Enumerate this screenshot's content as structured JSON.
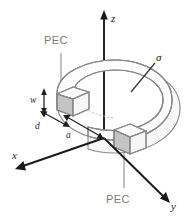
{
  "figure": {
    "background_color": "#ffffff",
    "width": 187,
    "height": 220
  },
  "axes": {
    "z": {
      "label": "z",
      "direction": "up",
      "color": "#1a1a1a"
    },
    "x": {
      "label": "x",
      "direction": "down-left",
      "color": "#1a1a1a"
    },
    "y": {
      "label": "y",
      "direction": "down-right",
      "color": "#1a1a1a"
    }
  },
  "annotations": {
    "pec_top": {
      "label": "PEC",
      "color": "#7b7b7b"
    },
    "pec_bottom": {
      "label": "PEC",
      "color": "#7b7b7b"
    },
    "sigma": {
      "label": "σ",
      "color": "#1a1a1a"
    }
  },
  "dimensions": {
    "w": {
      "label": "w",
      "description": "ring cross-section height"
    },
    "d": {
      "label": "d",
      "description": "ring cross-section depth"
    },
    "a": {
      "label": "a",
      "description": "inner radius from origin"
    }
  },
  "colors": {
    "ring_outline": "#8a8a8a",
    "pec_fill": "#c4c4c4",
    "axis": "#1a1a1a",
    "leader": "#8e8e8e"
  }
}
